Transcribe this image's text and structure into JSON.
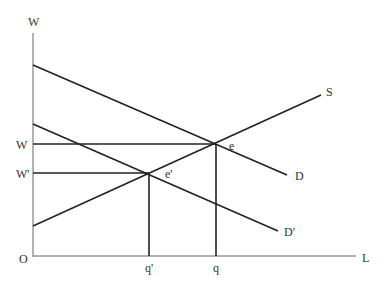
{
  "diagram": {
    "type": "labor market supply and demand",
    "axes": {
      "y_label": "W",
      "x_label": "L",
      "origin_label": "O"
    },
    "curves": {
      "demand": {
        "label": "D",
        "from": [
          33,
          65
        ],
        "to": [
          287,
          175
        ]
      },
      "demand_shifted": {
        "label": "D'",
        "from": [
          33,
          124
        ],
        "to": [
          278,
          231
        ]
      },
      "supply": {
        "label": "S",
        "from": [
          33,
          226
        ],
        "to": [
          321,
          95
        ]
      }
    },
    "equilibria": {
      "e": {
        "label": "e",
        "x": 216,
        "y": 144
      },
      "e_prime": {
        "label": "e'",
        "x": 149,
        "y": 173
      }
    },
    "wage_labels": {
      "w": "W",
      "w_prime": "W'"
    },
    "quantity_labels": {
      "q": "q",
      "q_prime": "q'"
    },
    "colors": {
      "line": "#222222",
      "axis": "#555555",
      "text": "#333333"
    }
  }
}
